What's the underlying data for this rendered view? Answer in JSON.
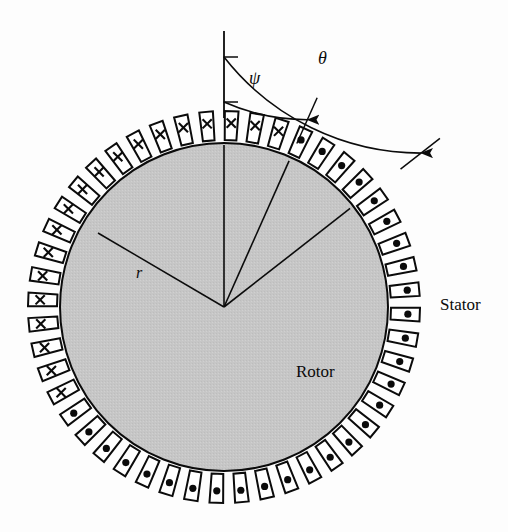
{
  "figure": {
    "kind": "machine-cross-section",
    "background_color": "#fdfdfd",
    "ink_color": "#0b0b0b",
    "rotor_fill": "#c6c6c6",
    "slot_fill": "#ffffff"
  },
  "labels": {
    "stator": "Stator",
    "rotor": "Rotor",
    "theta": "θ",
    "psi": "ψ",
    "radius": "r"
  },
  "geometry": {
    "center_x": 224,
    "center_y": 307,
    "rotor_radius": 164,
    "slot_inner_radius": 170,
    "slot_outer_radius": 196,
    "slot_count": 48,
    "slot_width_deg": 4.0,
    "tooth_gap_deg": 3.5,
    "reference_axis_deg": 90,
    "psi_axis_deg": 66,
    "theta_axis_deg": 38,
    "dot_cross_boundary_start_deg": 66,
    "dot_cross_boundary_end_deg": 208
  },
  "conductor_marks": {
    "out_of_page_symbol": "dot",
    "into_page_symbol": "cross"
  },
  "angles": {
    "psi_arc_radius": 205,
    "theta_arc_radius": 250,
    "psi_label_angle_deg": 78,
    "theta_label_angle_deg": 72
  },
  "chart_data": {
    "type": "diagram",
    "annotations": [
      {
        "name": "theta",
        "text": "θ",
        "meaning": "angle from vertical reference axis to outer radial tick"
      },
      {
        "name": "psi",
        "text": "ψ",
        "meaning": "angle from vertical reference axis to conductor polarity boundary"
      },
      {
        "name": "r",
        "text": "r",
        "meaning": "rotor radius"
      },
      {
        "name": "stator",
        "text": "Stator",
        "meaning": "outer slotted ring carrying conductors"
      },
      {
        "name": "rotor",
        "text": "Rotor",
        "meaning": "inner shaded cylinder"
      }
    ],
    "series": [
      {
        "name": "dot-slots",
        "symbol": "dot",
        "angle_range_deg": [
          208,
          426
        ]
      },
      {
        "name": "cross-slots",
        "symbol": "cross",
        "angle_range_deg": [
          66,
          208
        ]
      }
    ]
  }
}
